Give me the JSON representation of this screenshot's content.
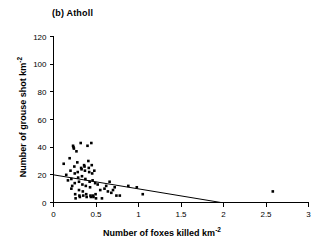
{
  "figure": {
    "panel_label": "(b)  Atholl"
  },
  "chart_data": {
    "type": "scatter",
    "title": "(b)  Atholl",
    "xlabel": "Number of foxes killed km",
    "xlabel_sup": "-2",
    "ylabel": "Number of grouse shot km",
    "ylabel_sup": "-2",
    "xlim": [
      0,
      3
    ],
    "ylim": [
      0,
      120
    ],
    "xticks": [
      0,
      0.5,
      1,
      1.5,
      2,
      2.5,
      3
    ],
    "xticklabels": [
      "0",
      "0.5",
      "1",
      "1.5",
      "2",
      "2.5",
      "3"
    ],
    "yticks": [
      0,
      20,
      40,
      60,
      80,
      100,
      120
    ],
    "yticklabels": [
      "0",
      "20",
      "40",
      "60",
      "80",
      "100",
      "120"
    ],
    "grid": false,
    "legend": false,
    "marker": "square",
    "marker_color": "#000000",
    "marker_size": 2.6,
    "points": [
      [
        0.12,
        28
      ],
      [
        0.15,
        20
      ],
      [
        0.17,
        16
      ],
      [
        0.19,
        32
      ],
      [
        0.2,
        23
      ],
      [
        0.21,
        17
      ],
      [
        0.21,
        10
      ],
      [
        0.22,
        12
      ],
      [
        0.23,
        41
      ],
      [
        0.235,
        40
      ],
      [
        0.24,
        39
      ],
      [
        0.245,
        26
      ],
      [
        0.25,
        21
      ],
      [
        0.25,
        14
      ],
      [
        0.255,
        6
      ],
      [
        0.26,
        3
      ],
      [
        0.27,
        37
      ],
      [
        0.28,
        29
      ],
      [
        0.285,
        22
      ],
      [
        0.29,
        18
      ],
      [
        0.3,
        15
      ],
      [
        0.3,
        9
      ],
      [
        0.305,
        5
      ],
      [
        0.31,
        4
      ],
      [
        0.32,
        43
      ],
      [
        0.325,
        25
      ],
      [
        0.33,
        24
      ],
      [
        0.335,
        19
      ],
      [
        0.34,
        13
      ],
      [
        0.345,
        8
      ],
      [
        0.35,
        5
      ],
      [
        0.36,
        27
      ],
      [
        0.365,
        26
      ],
      [
        0.37,
        23
      ],
      [
        0.375,
        17
      ],
      [
        0.38,
        12
      ],
      [
        0.385,
        6
      ],
      [
        0.39,
        4
      ],
      [
        0.4,
        41
      ],
      [
        0.41,
        30
      ],
      [
        0.415,
        25
      ],
      [
        0.42,
        22
      ],
      [
        0.425,
        15
      ],
      [
        0.43,
        11
      ],
      [
        0.435,
        5
      ],
      [
        0.44,
        4
      ],
      [
        0.445,
        43
      ],
      [
        0.45,
        27
      ],
      [
        0.455,
        21
      ],
      [
        0.46,
        16
      ],
      [
        0.465,
        5
      ],
      [
        0.47,
        4
      ],
      [
        0.48,
        23
      ],
      [
        0.49,
        14
      ],
      [
        0.495,
        6
      ],
      [
        0.5,
        3
      ],
      [
        0.52,
        13
      ],
      [
        0.55,
        9
      ],
      [
        0.57,
        3
      ],
      [
        0.6,
        10
      ],
      [
        0.62,
        12
      ],
      [
        0.64,
        8
      ],
      [
        0.66,
        15
      ],
      [
        0.68,
        7
      ],
      [
        0.7,
        9
      ],
      [
        0.72,
        11
      ],
      [
        0.74,
        5
      ],
      [
        0.78,
        5
      ],
      [
        0.88,
        12
      ],
      [
        0.98,
        11
      ],
      [
        1.05,
        6
      ],
      [
        2.58,
        8
      ]
    ],
    "regression_line": {
      "x": [
        0,
        1.97
      ],
      "y": [
        20,
        0
      ],
      "color": "#000000",
      "width": 1
    }
  }
}
